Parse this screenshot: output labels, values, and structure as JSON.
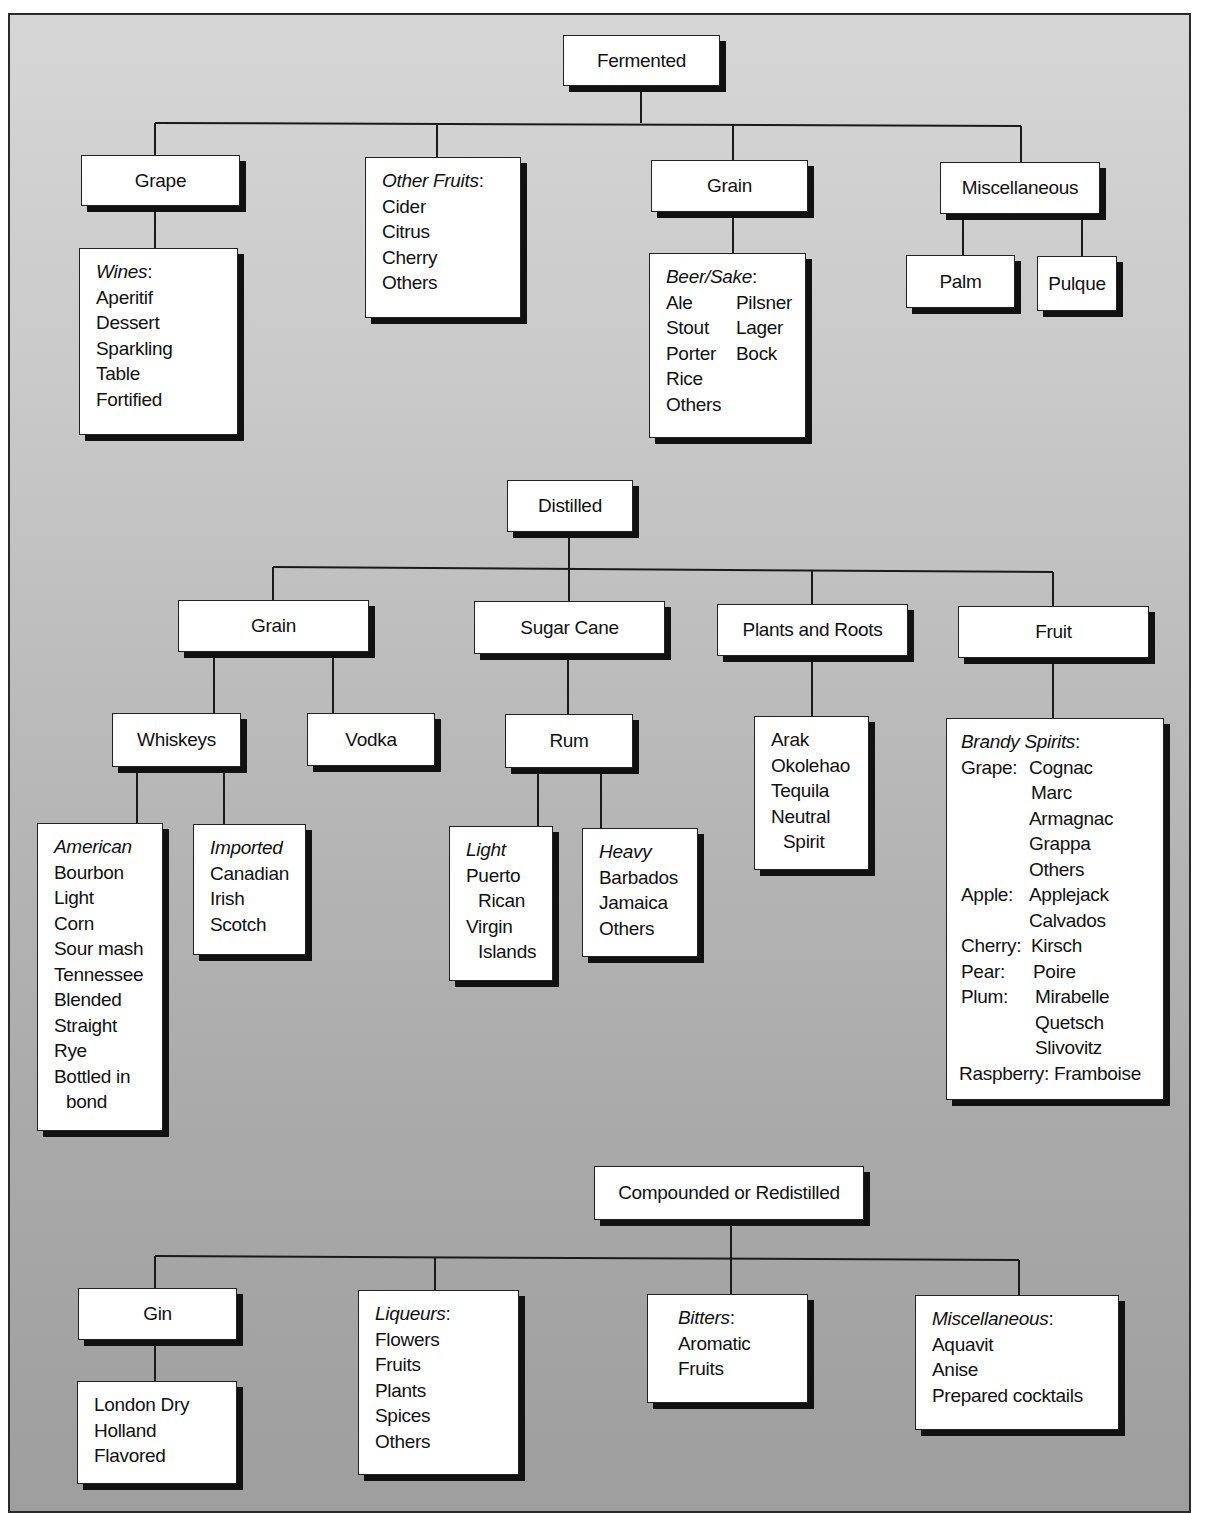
{
  "diagram": {
    "sections": {
      "fermented": {
        "label": "Fermented",
        "children": {
          "grape": {
            "label": "Grape",
            "list": {
              "heading": "Wines",
              "items": [
                "Aperitif",
                "Dessert",
                "Sparkling",
                "Table",
                "Fortified"
              ]
            }
          },
          "other_fruits": {
            "heading": "Other Fruits",
            "items": [
              "Cider",
              "Citrus",
              "Cherry",
              "Others"
            ]
          },
          "grain": {
            "label": "Grain",
            "list": {
              "heading": "Beer/Sake",
              "col1": [
                "Ale",
                "Stout",
                "Porter",
                "Rice",
                "Others"
              ],
              "col2": [
                "Pilsner",
                "Lager",
                "Bock"
              ]
            }
          },
          "misc": {
            "label": "Miscellaneous",
            "children": [
              "Palm",
              "Pulque"
            ]
          }
        }
      },
      "distilled": {
        "label": "Distilled",
        "children": {
          "grain": {
            "label": "Grain",
            "whiskeys": {
              "label": "Whiskeys",
              "american": {
                "heading": "American",
                "items": [
                  "Bourbon",
                  "Light",
                  "Corn",
                  "Sour mash",
                  "Tennessee",
                  "Blended",
                  "Straight",
                  "Rye",
                  "Bottled in",
                  "bond"
                ]
              },
              "imported": {
                "heading": "Imported",
                "items": [
                  "Canadian",
                  "Irish",
                  "Scotch"
                ]
              }
            },
            "vodka": {
              "label": "Vodka"
            }
          },
          "sugar_cane": {
            "label": "Sugar Cane",
            "rum": {
              "label": "Rum",
              "light": {
                "heading": "Light",
                "items": [
                  "Puerto",
                  "Rican",
                  "Virgin",
                  "Islands"
                ]
              },
              "heavy": {
                "heading": "Heavy",
                "items": [
                  "Barbados",
                  "Jamaica",
                  "Others"
                ]
              }
            }
          },
          "plants_roots": {
            "label": "Plants and Roots",
            "items": [
              "Arak",
              "Okolehao",
              "Tequila",
              "Neutral",
              "Spirit"
            ]
          },
          "fruit": {
            "label": "Fruit",
            "brandy": {
              "heading": "Brandy Spirits",
              "rows": [
                {
                  "key": "Grape:",
                  "value": "Cognac"
                },
                {
                  "key": "",
                  "value": "Marc"
                },
                {
                  "key": "",
                  "value": "Armagnac"
                },
                {
                  "key": "",
                  "value": "Grappa"
                },
                {
                  "key": "",
                  "value": "Others"
                },
                {
                  "key": "Apple:",
                  "value": "Applejack"
                },
                {
                  "key": "",
                  "value": "Calvados"
                },
                {
                  "key": "Cherry:",
                  "value": "Kirsch"
                },
                {
                  "key": "Pear:",
                  "value": "Poire"
                },
                {
                  "key": "Plum:",
                  "value": "Mirabelle"
                },
                {
                  "key": "",
                  "value": "Quetsch"
                },
                {
                  "key": "",
                  "value": "Slivovitz"
                },
                {
                  "key": "Raspberry:",
                  "value": "Framboise"
                }
              ]
            }
          }
        }
      },
      "compounded": {
        "label": "Compounded or Redistilled",
        "children": {
          "gin": {
            "label": "Gin",
            "items": [
              "London Dry",
              "Holland",
              "Flavored"
            ]
          },
          "liqueurs": {
            "heading": "Liqueurs",
            "items": [
              "Flowers",
              "Fruits",
              "Plants",
              "Spices",
              "Others"
            ]
          },
          "bitters": {
            "heading": "Bitters",
            "items": [
              "Aromatic",
              "Fruits"
            ]
          },
          "misc": {
            "heading": "Miscellaneous",
            "items": [
              "Aquavit",
              "Anise",
              "Prepared cocktails"
            ]
          }
        }
      }
    }
  },
  "colors": {
    "background_top": "#d6d6d6",
    "background_bottom": "#9e9e9e",
    "box": "#ffffff",
    "line": "#1a1a1a",
    "shadow": "#111111"
  }
}
